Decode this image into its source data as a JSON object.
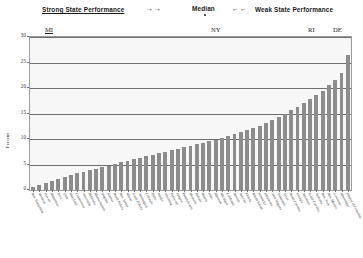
{
  "header": {
    "strong_label": "Strong State Performance",
    "weak_label": "Weak State Performance",
    "median_label": "Median",
    "right_arrows": "→→",
    "left_arrows": "←←",
    "median_marker_icon": "square-dot-marker"
  },
  "callouts": [
    {
      "label": "MI",
      "x_pct": 5.0
    },
    {
      "label": "NY",
      "x_pct": 56.4
    },
    {
      "label": "RI",
      "x_pct": 86.4
    },
    {
      "label": "DE",
      "x_pct": 94.1
    }
  ],
  "chart_data": {
    "type": "bar",
    "title": "",
    "subtitle": "",
    "xlabel": "",
    "ylabel": "Percent",
    "ylim": [
      0,
      30
    ],
    "yticks": [
      0,
      5,
      10,
      15,
      20,
      25,
      30
    ],
    "ytick_labels": [
      "0",
      "5",
      "10",
      "15",
      "20",
      "25",
      "30"
    ],
    "grid": true,
    "grid_axis": "y",
    "legend": "none",
    "bar_color": "#8c8c8c",
    "plot_background": "#f7f7f7",
    "sorted": "ascending",
    "categories": [
      "New Hampshire",
      "Vermont",
      "Hawaii",
      "Minnesota",
      "Iowa",
      "Utah",
      "Maryland",
      "Connecticut",
      "Wisconsin",
      "Nebraska",
      "Massachusetts",
      "Virginia",
      "Kansas",
      "North Dakota",
      "New Jersey",
      "Maine",
      "South Dakota",
      "Washington",
      "Colorado",
      "Idaho",
      "Alaska",
      "Wyoming",
      "Delaware",
      "Oregon",
      "Pennsylvania",
      "Montana",
      "Indiana",
      "Illinois",
      "Ohio",
      "Missouri",
      "Michigan",
      "California",
      "Nevada",
      "Arizona",
      "Florida",
      "Rhode Island",
      "Kentucky",
      "Oklahoma",
      "West Virginia",
      "Tennessee",
      "Texas",
      "North Carolina",
      "Georgia",
      "Arkansas",
      "South Carolina",
      "Alabama",
      "New York",
      "New Mexico",
      "Louisiana",
      "Mississippi",
      "District of Columbia"
    ],
    "values": [
      0.6,
      1.0,
      1.4,
      1.8,
      2.2,
      2.6,
      3.0,
      3.3,
      3.6,
      3.9,
      4.2,
      4.5,
      4.8,
      5.1,
      5.4,
      5.7,
      6.0,
      6.3,
      6.6,
      6.9,
      7.2,
      7.5,
      7.8,
      8.1,
      8.4,
      8.7,
      9.0,
      9.3,
      9.6,
      9.9,
      10.2,
      10.5,
      10.9,
      11.3,
      11.7,
      12.1,
      12.6,
      13.2,
      13.8,
      14.4,
      15.0,
      15.6,
      16.3,
      17.0,
      17.8,
      18.6,
      19.5,
      20.5,
      21.6,
      23.0,
      26.5
    ]
  }
}
